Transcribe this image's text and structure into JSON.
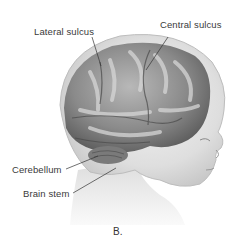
{
  "figure": {
    "caption": "B.",
    "labels": [
      {
        "id": "lateral-sulcus",
        "text": "Lateral sulcus"
      },
      {
        "id": "central-sulcus",
        "text": "Central sulcus"
      },
      {
        "id": "cerebellum",
        "text": "Cerebellum"
      },
      {
        "id": "brain-stem",
        "text": "Brain stem"
      }
    ]
  }
}
